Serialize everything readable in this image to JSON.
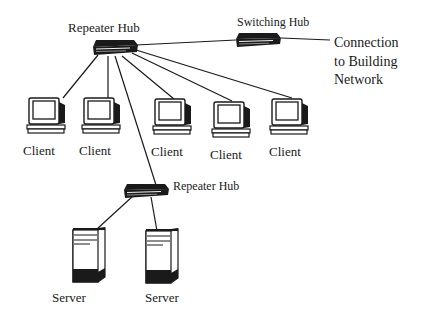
{
  "diagram": {
    "labels": {
      "top_hub": "Repeater Hub",
      "switch_hub": "Switching Hub",
      "lower_hub": "Repeater Hub",
      "connection_lines": [
        "Connection",
        "to Building",
        "Network"
      ]
    },
    "clients": [
      {
        "label": "Client"
      },
      {
        "label": "Client"
      },
      {
        "label": "Client"
      },
      {
        "label": "Client"
      },
      {
        "label": "Client"
      }
    ],
    "servers": [
      {
        "label": "Server"
      },
      {
        "label": "Server"
      }
    ],
    "icons": {
      "hub": "hub-icon",
      "switch": "switch-icon",
      "client": "monitor-icon",
      "server": "server-tower-icon"
    },
    "colors": {
      "line": "#1a1a1a",
      "device_dark": "#1a1a1a",
      "device_light": "#f2f2f2",
      "background": "#ffffff"
    }
  }
}
